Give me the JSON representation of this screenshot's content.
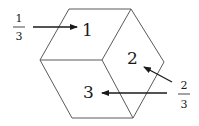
{
  "diagram": {
    "faces": [
      {
        "id": "1",
        "label": "1"
      },
      {
        "id": "2",
        "label": "2"
      },
      {
        "id": "3",
        "label": "3"
      }
    ],
    "annotations": [
      {
        "target": "1",
        "numerator": "1",
        "denominator": "3"
      },
      {
        "target": "2",
        "numerator": "2",
        "denominator": "3"
      }
    ],
    "colors": {
      "lines": "#5a5a5a",
      "text": "#1a1a1a",
      "background": "#ffffff"
    }
  }
}
